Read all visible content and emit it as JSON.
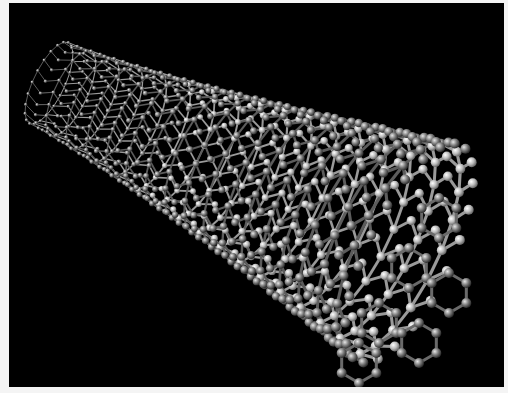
{
  "image": {
    "subject": "carbon nanotube ball-and-stick model",
    "background_color": "#000000",
    "border_color": "#f4f4f4",
    "atom_color_dark": "#5a5a5a",
    "atom_color_light": "#c8c8c8",
    "bond_color": "#8a8a8a"
  }
}
